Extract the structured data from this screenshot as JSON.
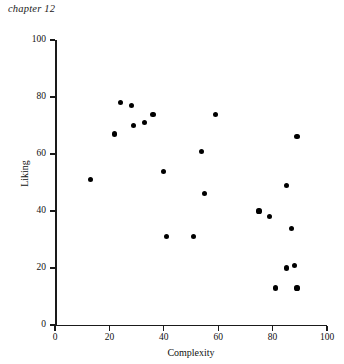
{
  "header": {
    "chapter_label": "chapter 12"
  },
  "chart_data": {
    "type": "scatter",
    "title": "",
    "xlabel": "Complexity",
    "ylabel": "Liking",
    "xlim": [
      0,
      100
    ],
    "ylim": [
      0,
      100
    ],
    "xticks": [
      0,
      20,
      40,
      60,
      80,
      100
    ],
    "yticks": [
      0,
      20,
      40,
      60,
      80,
      100
    ],
    "xtick_labels": [
      "0",
      "20",
      "40",
      "60",
      "80",
      "100"
    ],
    "ytick_labels": [
      "0",
      "20",
      "40",
      "60",
      "80",
      "100"
    ],
    "grid": false,
    "legend": null,
    "series": [
      {
        "name": "observations",
        "marker": "filled-circle",
        "color": "#000000",
        "points": [
          {
            "x": 13,
            "y": 51
          },
          {
            "x": 22,
            "y": 67
          },
          {
            "x": 24,
            "y": 78
          },
          {
            "x": 28,
            "y": 77
          },
          {
            "x": 29,
            "y": 70
          },
          {
            "x": 33,
            "y": 71
          },
          {
            "x": 36,
            "y": 74
          },
          {
            "x": 40,
            "y": 54
          },
          {
            "x": 41,
            "y": 31
          },
          {
            "x": 51,
            "y": 31
          },
          {
            "x": 54,
            "y": 61
          },
          {
            "x": 55,
            "y": 46
          },
          {
            "x": 59,
            "y": 74
          },
          {
            "x": 75,
            "y": 40
          },
          {
            "x": 79,
            "y": 38
          },
          {
            "x": 85,
            "y": 49
          },
          {
            "x": 85,
            "y": 20
          },
          {
            "x": 87,
            "y": 34
          },
          {
            "x": 88,
            "y": 21
          },
          {
            "x": 81,
            "y": 13
          },
          {
            "x": 89,
            "y": 13
          },
          {
            "x": 89,
            "y": 66
          }
        ]
      }
    ]
  }
}
